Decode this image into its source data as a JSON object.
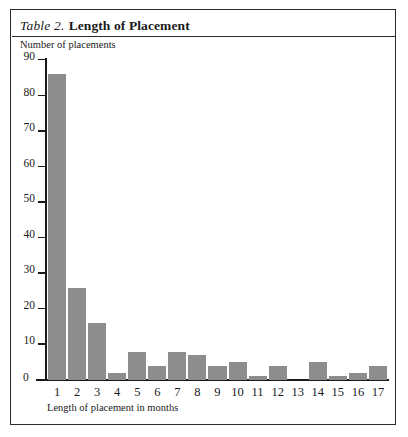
{
  "figure": {
    "title_prefix": "Table 2.",
    "title_main": "Length of Placement",
    "bar_color": "#8d8d8d",
    "frame_color": "#2b2b2b"
  },
  "chart_data": {
    "type": "bar",
    "title": "Table 2. Length of Placement",
    "xlabel": "Length of placement in months",
    "ylabel": "Number of placements",
    "categories": [
      "1",
      "2",
      "3",
      "4",
      "5",
      "6",
      "7",
      "8",
      "9",
      "10",
      "11",
      "12",
      "13",
      "14",
      "15",
      "16",
      "17"
    ],
    "values": [
      86,
      26,
      16,
      2,
      8,
      4,
      8,
      7,
      4,
      5,
      1,
      4,
      0,
      5,
      1,
      2,
      4
    ],
    "yticks": [
      0,
      10,
      20,
      30,
      40,
      50,
      60,
      70,
      80,
      90
    ],
    "ytick_labels": [
      "0",
      "10",
      "20",
      "30",
      "40",
      "50",
      "60",
      "70",
      "80",
      "90"
    ],
    "ylim": [
      0,
      90
    ],
    "grid": false,
    "legend": false
  }
}
